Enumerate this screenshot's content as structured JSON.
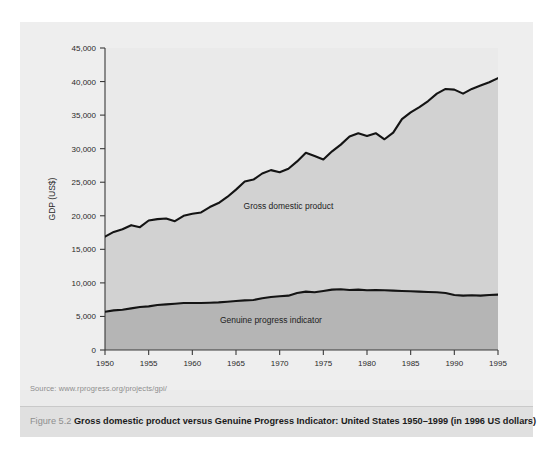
{
  "figure": {
    "number": "Figure 5.2",
    "title": "Gross domestic product versus Genuine Progress Indicator: United States 1950–1999 (in 1996 US dollars)",
    "source": "Source: www.rprogress.org/projects/gpi/"
  },
  "colors": {
    "page_background": "#ffffff",
    "panel_background": "#eeeeee",
    "caption_background": "#e0e0e0",
    "above_gdp_fill": "#eaeaea",
    "gdp_band_fill": "#d2d2d2",
    "gpi_band_fill": "#b5b5b5",
    "line": "#141414",
    "axis": "#3a3a3a",
    "figure_number_text": "#8f8f8f",
    "caption_text": "#1b1b1b",
    "source_text": "#8d8d8d"
  },
  "chart_data": {
    "type": "area",
    "title": "Gross domestic product versus Genuine Progress Indicator: United States 1950–1999 (in 1996 US dollars)",
    "xlabel": "",
    "ylabel": "GDP (US$)",
    "xlim": [
      1950,
      1995
    ],
    "ylim": [
      0,
      45000
    ],
    "grid": false,
    "legend_position": "in-plot-annotation",
    "xticks": [
      1950,
      1955,
      1960,
      1965,
      1970,
      1975,
      1980,
      1985,
      1990,
      1995
    ],
    "xtick_labels": [
      "1950",
      "1955",
      "1960",
      "1965",
      "1970",
      "1975",
      "1980",
      "1985",
      "1990",
      "1995"
    ],
    "yticks": [
      0,
      5000,
      10000,
      15000,
      20000,
      25000,
      30000,
      35000,
      40000,
      45000
    ],
    "ytick_labels": [
      "0",
      "5,000",
      "10,000",
      "15,000",
      "20,000",
      "25,000",
      "30,000",
      "35,000",
      "40,000",
      "45,000"
    ],
    "x": [
      1950,
      1951,
      1952,
      1953,
      1954,
      1955,
      1956,
      1957,
      1958,
      1959,
      1960,
      1961,
      1962,
      1963,
      1964,
      1965,
      1966,
      1967,
      1968,
      1969,
      1970,
      1971,
      1972,
      1973,
      1974,
      1975,
      1976,
      1977,
      1978,
      1979,
      1980,
      1981,
      1982,
      1983,
      1984,
      1985,
      1986,
      1987,
      1988,
      1989,
      1990,
      1991,
      1992,
      1993,
      1994,
      1995
    ],
    "series": [
      {
        "name": "Gross domestic product",
        "label_in_plot": "Gross domestic product",
        "values": [
          16900,
          17600,
          18000,
          18600,
          18300,
          19300,
          19500,
          19600,
          19200,
          20000,
          20300,
          20500,
          21300,
          21900,
          22800,
          23900,
          25100,
          25400,
          26300,
          26800,
          26500,
          27000,
          28100,
          29400,
          28900,
          28400,
          29600,
          30600,
          31800,
          32300,
          31900,
          32300,
          31400,
          32400,
          34400,
          35400,
          36200,
          37100,
          38200,
          38900,
          38800,
          38200,
          38900,
          39400,
          39900,
          40500
        ]
      },
      {
        "name": "Genuine progress indicator",
        "label_in_plot": "Genuine progress indicator",
        "values": [
          5700,
          5900,
          6000,
          6200,
          6400,
          6500,
          6700,
          6800,
          6900,
          7000,
          7000,
          7000,
          7050,
          7100,
          7200,
          7300,
          7400,
          7450,
          7700,
          7900,
          8000,
          8100,
          8500,
          8700,
          8600,
          8800,
          9000,
          9050,
          8950,
          9000,
          8900,
          8950,
          8900,
          8850,
          8800,
          8750,
          8700,
          8650,
          8600,
          8500,
          8200,
          8100,
          8150,
          8100,
          8200,
          8250
        ]
      }
    ],
    "annotations": [
      {
        "text": "Gross domestic product",
        "x": 1971,
        "y": 21000
      },
      {
        "text": "Genuine progress indicator",
        "x": 1969,
        "y": 4000
      }
    ]
  }
}
